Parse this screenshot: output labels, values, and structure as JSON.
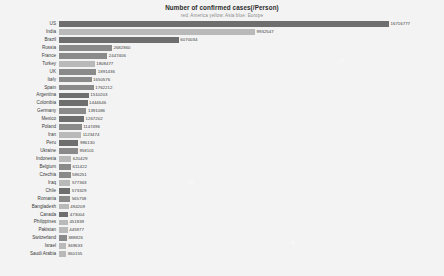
{
  "header": {
    "title": "Number of confirmed cases(/Person)",
    "subtitle": "red: America  yellow: Asia  blue: Europe"
  },
  "colors": {
    "background": "#f3f3f3",
    "america": "#6e6e6e",
    "asia": "#b9b9b9",
    "europe": "#8a8a8a",
    "text": "#3a3a3a",
    "subtitle": "#8c8c8c"
  },
  "legend": {
    "position": "top-center",
    "entries": [
      {
        "label": "America",
        "color": "#6e6e6e"
      },
      {
        "label": "Asia",
        "color": "#b9b9b9"
      },
      {
        "label": "Europe",
        "color": "#8a8a8a"
      }
    ]
  },
  "chart_data": {
    "type": "bar",
    "orientation": "horizontal",
    "title": "Number of confirmed cases(/Person)",
    "subtitle": "red: America  yellow: Asia  blue: Europe",
    "xlabel": "",
    "ylabel": "",
    "grid": false,
    "xlim": [
      0,
      16716777
    ],
    "categories": [
      "US",
      "India",
      "Brazil",
      "Russia",
      "France",
      "Turkey",
      "UK",
      "Italy",
      "Spain",
      "Argentina",
      "Colombia",
      "Germany",
      "Mexico",
      "Poland",
      "Iran",
      "Peru",
      "Ukraine",
      "Indonesia",
      "Belgium",
      "Czechia",
      "Iraq",
      "Chile",
      "Romania",
      "Bangladesh",
      "Canada",
      "Philippines",
      "Pakistan",
      "Switzerland",
      "Israel",
      "Saudi Arabia"
    ],
    "values": [
      16716777,
      9932547,
      6070034,
      2682860,
      2447406,
      1808477,
      1891436,
      1650576,
      1762212,
      1510203,
      1444646,
      1391086,
      1267202,
      1147496,
      1123474,
      986130,
      958101,
      620429,
      611422,
      586251,
      577363,
      573329,
      565758,
      494209,
      473004,
      451839,
      445977,
      388826,
      369633,
      360155
    ],
    "groups": [
      "america",
      "asia",
      "america",
      "europe",
      "europe",
      "asia",
      "europe",
      "europe",
      "europe",
      "america",
      "america",
      "europe",
      "america",
      "europe",
      "asia",
      "america",
      "europe",
      "asia",
      "europe",
      "europe",
      "asia",
      "america",
      "europe",
      "asia",
      "america",
      "asia",
      "asia",
      "europe",
      "asia",
      "asia"
    ]
  }
}
